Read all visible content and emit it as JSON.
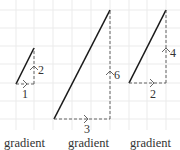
{
  "diagram": {
    "grid_color": "#ebebeb",
    "line_color": "#1a1a1a",
    "dash_color": "#555555",
    "triangles": [
      {
        "run": "1",
        "rise": "2",
        "caption": "gradient"
      },
      {
        "run": "3",
        "rise": "6",
        "caption": "gradient"
      },
      {
        "run": "2",
        "rise": "4",
        "caption": "gradient"
      }
    ]
  }
}
